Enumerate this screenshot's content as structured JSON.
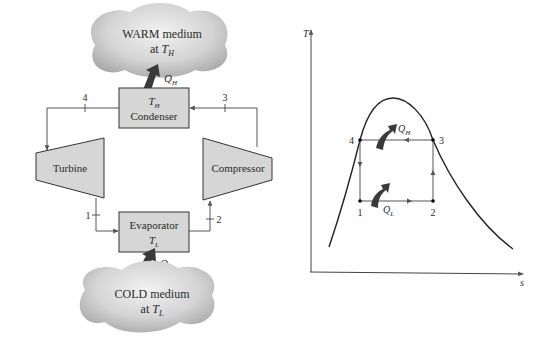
{
  "schematic": {
    "warm_medium": {
      "line1": "WARM medium",
      "line2_prefix": "at ",
      "symbol": "T",
      "subscript": "H"
    },
    "cold_medium": {
      "line1": "COLD medium",
      "line2_prefix": "at ",
      "symbol": "T",
      "subscript": "L"
    },
    "condenser": {
      "symbol": "T",
      "subscript": "H",
      "label": "Condenser"
    },
    "evaporator": {
      "label": "Evaporator",
      "symbol": "T",
      "subscript": "L"
    },
    "turbine": {
      "label": "Turbine"
    },
    "compressor": {
      "label": "Compressor"
    },
    "heat_out": {
      "symbol": "Q",
      "subscript": "H"
    },
    "heat_in": {
      "symbol": "Q",
      "subscript": "L"
    },
    "states": [
      "1",
      "2",
      "3",
      "4"
    ]
  },
  "ts_diagram": {
    "y_axis_label": "T",
    "x_axis_label": "s",
    "points": {
      "p1": "1",
      "p2": "2",
      "p3": "3",
      "p4": "4"
    },
    "heat_out": {
      "symbol": "Q",
      "subscript": "H"
    },
    "heat_in": {
      "symbol": "Q",
      "subscript": "L"
    }
  },
  "colors": {
    "box_fill": "#d6d6d6",
    "cloud_fill": "#c8c8c8",
    "arrow_fill": "#3a3a3a",
    "line": "#555555"
  }
}
